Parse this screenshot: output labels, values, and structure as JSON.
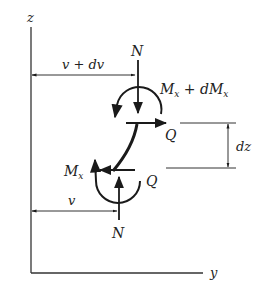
{
  "diagram": {
    "type": "free-body diagram of beam element",
    "colors": {
      "ink": "#1a1a1a",
      "background": "#ffffff"
    },
    "axes": {
      "vertical_label": "z",
      "horizontal_label": "y"
    },
    "dimensions": {
      "top_offset": "v + dv",
      "bottom_offset": "v",
      "element_length": "dz"
    },
    "forces": {
      "top_axial": "N",
      "bottom_axial": "N",
      "top_shear": "Q",
      "bottom_shear": "Q"
    },
    "moments": {
      "top_moment_main": "M",
      "top_moment_sub": "x",
      "top_moment_plus": " + dM",
      "top_moment_sub2": "x",
      "bottom_moment_main": "M",
      "bottom_moment_sub": "x"
    }
  }
}
